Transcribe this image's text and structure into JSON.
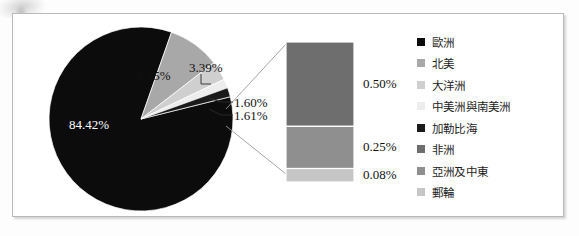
{
  "chart_data": {
    "type": "pie",
    "variant": "bar-of-pie",
    "title": "",
    "xlabel": "",
    "ylabel": "",
    "legend_position": "right",
    "grid": false,
    "categories": [
      "歐洲",
      "北美",
      "大洋洲",
      "中美洲與南美洲",
      "加勒比海",
      "非洲",
      "亞洲及中東",
      "郵輪"
    ],
    "values": [
      84.42,
      9.15,
      3.39,
      1.6,
      1.61,
      0.5,
      0.25,
      0.08
    ],
    "value_labels": [
      "84.42%",
      "9.15%",
      "3.39%",
      "1.60%",
      "1.61%",
      "0.50%",
      "0.25%",
      "0.08%"
    ],
    "colors": [
      "#0c0c0c",
      "#a8a8a8",
      "#cfcfcf",
      "#ededed",
      "#1a1a1a",
      "#6e6e6e",
      "#8f8f8f",
      "#c6c6c6"
    ],
    "pie_slices": [
      {
        "label": "84.42%",
        "value": 84.42,
        "color": "#0c0c0c",
        "category": "歐洲"
      },
      {
        "label": "9.15%",
        "value": 9.15,
        "color": "#a8a8a8",
        "category": "北美"
      },
      {
        "label": "3.39%",
        "value": 3.39,
        "color": "#cfcfcf",
        "category": "大洋洲"
      },
      {
        "label": "1.60%",
        "value": 1.6,
        "color": "#ededed",
        "category": "中美洲與南美洲"
      },
      {
        "label": "1.61%",
        "value": 1.61,
        "color": "#1a1a1a",
        "category": "加勒比海"
      }
    ],
    "bar_segments": [
      {
        "label": "0.50%",
        "value": 0.5,
        "color": "#6e6e6e",
        "category": "非洲"
      },
      {
        "label": "0.25%",
        "value": 0.25,
        "color": "#8f8f8f",
        "category": "亞洲及中東"
      },
      {
        "label": "0.08%",
        "value": 0.08,
        "color": "#c6c6c6",
        "category": "郵輪"
      }
    ]
  },
  "pie": {
    "label_84": "84.42%",
    "label_915": "9.15%",
    "label_339": "3.39%",
    "label_160": "1.60%",
    "label_161": "1.61%"
  },
  "bar": {
    "label_050": "0.50%",
    "label_025": "0.25%",
    "label_008": "0.08%"
  },
  "legend": {
    "items": [
      {
        "label": "歐洲",
        "color": "#0c0c0c"
      },
      {
        "label": "北美",
        "color": "#a8a8a8"
      },
      {
        "label": "大洋洲",
        "color": "#cfcfcf"
      },
      {
        "label": "中美洲與南美洲",
        "color": "#ededed"
      },
      {
        "label": "加勒比海",
        "color": "#1a1a1a"
      },
      {
        "label": "非洲",
        "color": "#6e6e6e"
      },
      {
        "label": "亞洲及中東",
        "color": "#8f8f8f"
      },
      {
        "label": "郵輪",
        "color": "#c6c6c6"
      }
    ]
  }
}
